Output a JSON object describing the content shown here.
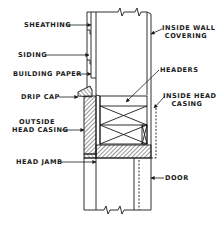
{
  "diagram": {
    "colors": {
      "ink": "#1a1a1a",
      "background": "#ffffff"
    },
    "labels": {
      "sheathing": "SHEATHING",
      "siding": "SIDING",
      "building_paper": "BUILDING PAPER",
      "drip_cap": "DRIP CAP",
      "outside_head_casing_line1": "OUTSIDE",
      "outside_head_casing_line2": "HEAD CASING",
      "head_jamb": "HEAD JAMB",
      "inside_wall_covering_line1": "INSIDE WALL",
      "inside_wall_covering_line2": "COVERING",
      "headers": "HEADERS",
      "inside_head_casing_line1": "INSIDE HEAD",
      "inside_head_casing_line2": "CASING",
      "door": "DOOR"
    }
  }
}
